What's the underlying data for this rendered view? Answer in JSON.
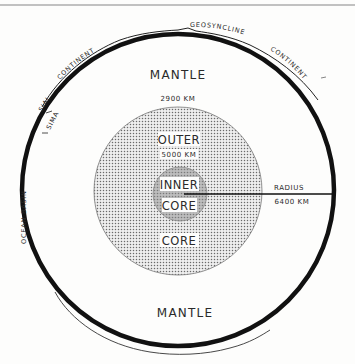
{
  "diagram": {
    "type": "earth-cross-section",
    "labels": {
      "mantle_top": "MANTLE",
      "mantle_bottom": "MANTLE",
      "mantle_depth": "2900 KM",
      "outer_core_top": "OUTER",
      "outer_core_bottom": "CORE",
      "inner_core_depth": "5000 KM",
      "inner_core_line1": "INNER",
      "inner_core_line2": "CORE",
      "radius_label": "RADIUS",
      "radius_value": "6400 KM",
      "continent_left": "CONTINENT",
      "continent_right": "CONTINENT",
      "geosyncline": "GEOSYNCLINE",
      "sial": "SIAL",
      "sima": "SIMA",
      "ocean_basin": "OCEAN BASIN"
    },
    "layers": [
      {
        "name": "crust",
        "color": "#111111"
      },
      {
        "name": "mantle",
        "color": "#fdfdfc"
      },
      {
        "name": "outer-core",
        "color": "#d9d9d9",
        "pattern": "dotted"
      },
      {
        "name": "inner-core",
        "color": "#c4c4c4"
      }
    ]
  }
}
